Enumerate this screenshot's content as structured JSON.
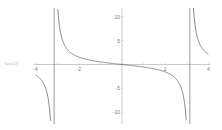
{
  "chart_data": {
    "type": "line",
    "title": "",
    "function": "-tan(x/2)",
    "xlabel": "",
    "ylabel": "",
    "left_axis_label": "Tan[x/2]",
    "xlim": [
      -4,
      4
    ],
    "ylim": [
      -12,
      12
    ],
    "x_ticks": [
      -4,
      -2,
      2,
      4
    ],
    "y_ticks": [
      10,
      5,
      -5,
      -10
    ],
    "x_tick_labels": [
      "-4",
      "-2",
      "2",
      "4"
    ],
    "y_tick_labels": [
      "10",
      "5",
      "-5",
      "-10"
    ],
    "asymptotes": [
      -3.1416,
      3.1416
    ],
    "grid": false,
    "legend": null,
    "series": [
      {
        "name": "f(x)",
        "x": [
          -4,
          -3.8,
          -3.6,
          -3.4,
          -3.25,
          3.25,
          3.4,
          3.6,
          3.8,
          4
        ],
        "values": [
          -2.19,
          -3.08,
          -4.29,
          -7.67,
          -18.5,
          18.5,
          7.67,
          4.29,
          3.08,
          2.19
        ]
      },
      {
        "name": "central branch",
        "x": [
          -3.0,
          -2.8,
          -2.5,
          -2,
          -1.5,
          -1,
          -0.5,
          0,
          0.5,
          1,
          1.5,
          2,
          2.5,
          2.8,
          3.0
        ],
        "values": [
          14.1,
          5.8,
          3.01,
          1.56,
          0.93,
          0.55,
          0.26,
          0,
          -0.26,
          -0.55,
          -0.93,
          -1.56,
          -3.01,
          -5.8,
          -14.1
        ]
      }
    ],
    "colors": {
      "curve": "#555555",
      "axis": "#999999",
      "asymptote": "#555555"
    }
  }
}
